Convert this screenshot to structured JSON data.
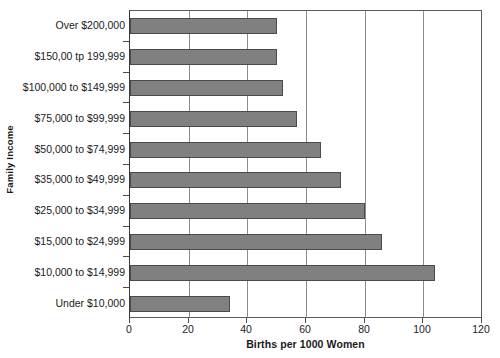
{
  "chart_data": {
    "type": "bar",
    "orientation": "horizontal",
    "title": "",
    "xlabel": "Births per 1000 Women",
    "ylabel": "Family Income",
    "xlim": [
      0,
      120
    ],
    "xticks": [
      0,
      20,
      40,
      60,
      80,
      100,
      120
    ],
    "xtick_labels": [
      "0",
      "20",
      "40",
      "60",
      "80",
      "100",
      "120"
    ],
    "grid": "vertical",
    "legend": "none",
    "bar_color": "#808080",
    "bar_edge_color": "#4a4a4a",
    "categories": [
      "Over $200,000",
      "$150,00 tp 199,999",
      "$100,000 to $149,999",
      "$75,000 to $99,999",
      "$50,000 to $74,999",
      "$35,000 to $49,999",
      "$25,000 to $34,999",
      "$15,000 to $24,999",
      "$10,000 to $14,999",
      "Under $10,000"
    ],
    "values": [
      50,
      50,
      52,
      57,
      65,
      72,
      80,
      86,
      104,
      34
    ]
  }
}
